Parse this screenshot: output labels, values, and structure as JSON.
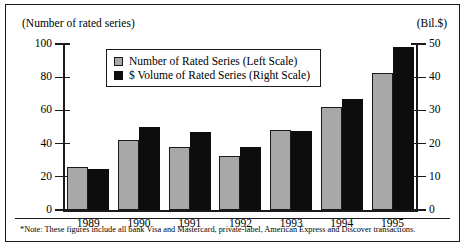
{
  "axes": {
    "left_caption": "(Number of rated series)",
    "right_caption": "(Bil.$)",
    "left_ticks": [
      "100",
      "80",
      "60",
      "40",
      "20",
      "0"
    ],
    "right_ticks": [
      "50",
      "40",
      "30",
      "20",
      "10",
      "0"
    ]
  },
  "legend": {
    "items": [
      {
        "label": "Number of Rated Series (Left Scale)",
        "swatch": "gray-square-icon",
        "color": "#a8a8a8"
      },
      {
        "label": "$ Volume of Rated Series (Right Scale)",
        "swatch": "black-square-icon",
        "color": "#0d0d0d"
      }
    ]
  },
  "note": "*Note:  These figures include all bank Visa and Mastercard, private-label, American Express and Discover transactions.",
  "chart_data": {
    "type": "bar",
    "title": "",
    "xlabel": "",
    "ylabel": "(Number of rated series)",
    "y2label": "(Bil.$)",
    "categories": [
      "1989",
      "1990",
      "1991",
      "1992",
      "1993",
      "1994",
      "1995"
    ],
    "ylim": [
      0,
      100
    ],
    "y2lim": [
      0,
      50
    ],
    "yticks": [
      0,
      20,
      40,
      60,
      80,
      100
    ],
    "y2ticks": [
      0,
      10,
      20,
      30,
      40,
      50
    ],
    "grid": false,
    "legend_position": "upper-center",
    "series": [
      {
        "name": "Number of Rated Series (Left Scale)",
        "axis": "left",
        "color": "#a8a8a8",
        "values": [
          26,
          42,
          38,
          32.5,
          48,
          62,
          82.5
        ]
      },
      {
        "name": "$ Volume of Rated Series (Right Scale)",
        "axis": "right",
        "color": "#0d0d0d",
        "values": [
          12.3,
          25,
          23.5,
          19,
          23.8,
          33.5,
          49
        ]
      }
    ]
  }
}
